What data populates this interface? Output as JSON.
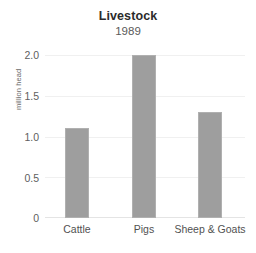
{
  "chart_data": {
    "type": "bar",
    "title": "Livestock",
    "subtitle": "1989",
    "xlabel": "",
    "ylabel": "million head",
    "categories": [
      "Cattle",
      "Pigs",
      "Sheep & Goats"
    ],
    "values": [
      1.1,
      2.0,
      1.3
    ],
    "ylim": [
      0,
      2.0
    ],
    "yticks": [
      "0",
      "0.5",
      "1.0",
      "1.5",
      "2.0"
    ],
    "ytick_values": [
      0,
      0.5,
      1.0,
      1.5,
      2.0
    ],
    "grid": true,
    "legend": false,
    "bar_color": "#9e9e9e",
    "background_color": "#ffffff"
  },
  "axis": {
    "y_title": "million head",
    "y_labels": {
      "t0": "0",
      "t1": "0.5",
      "t2": "1.0",
      "t3": "1.5",
      "t4": "2.0"
    },
    "x_labels": {
      "c0": "Cattle",
      "c1": "Pigs",
      "c2": "Sheep & Goats"
    }
  },
  "header": {
    "title": "Livestock",
    "subtitle": "1989"
  }
}
